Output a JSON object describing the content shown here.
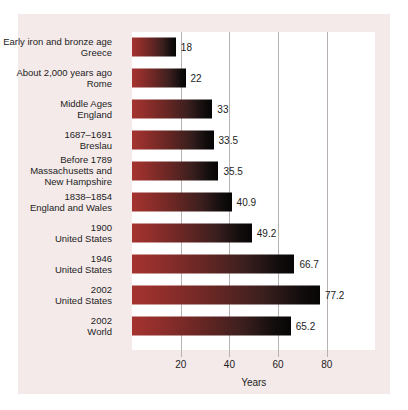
{
  "figure": {
    "axis_title": "Years",
    "card_background": "#f4eaea",
    "plot_background": "#ffffff",
    "bar_color_start": "#a5332f",
    "bar_color_end": "#070505",
    "gridline_color": "#b9b2b2",
    "text_color": "#1d1d1d"
  },
  "chart_data": {
    "type": "bar",
    "orientation": "horizontal",
    "title": "",
    "subtitle": "",
    "xlabel": "Years",
    "ylabel": "",
    "xlim": [
      0,
      100
    ],
    "grid": true,
    "legend": false,
    "xticks": [
      20,
      40,
      60,
      80
    ],
    "xtick_labels": [
      "20",
      "40",
      "60",
      "80"
    ],
    "categories": [
      "Early iron and bronze age\nGreece",
      "About 2,000 years ago\nRome",
      "Middle Ages\nEngland",
      "1687–1691\nBreslau",
      "Before 1789\nMassachusetts and\nNew Hampshire",
      "1838–1854\nEngland and Wales",
      "1900\nUnited States",
      "1946\nUnited States",
      "2002\nUnited States",
      "2002\nWorld"
    ],
    "values": [
      18,
      22,
      33,
      33.5,
      35.5,
      40.9,
      49.2,
      66.7,
      77.2,
      65.2
    ],
    "value_labels": [
      "18",
      "22",
      "33",
      "33.5",
      "35.5",
      "40.9",
      "49.2",
      "66.7",
      "77.2",
      "65.2"
    ]
  }
}
